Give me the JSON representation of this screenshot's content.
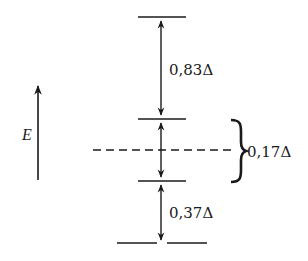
{
  "diagram": {
    "type": "energy-level-diagram",
    "axis": {
      "label": "E",
      "direction": "up"
    },
    "levels": [
      {
        "name": "top",
        "y": 17
      },
      {
        "name": "upper-middle",
        "y": 119
      },
      {
        "name": "barycenter-dashed",
        "y": 150,
        "style": "dashed"
      },
      {
        "name": "lower-middle",
        "y": 181
      },
      {
        "name": "bottom",
        "y": 243
      }
    ],
    "gaps": [
      {
        "label": "0,83Δ",
        "from": "upper-middle",
        "to": "top"
      },
      {
        "label": "0,17Δ",
        "from": "lower-middle",
        "to": "upper-middle",
        "annotation": "brace"
      },
      {
        "label": "0,37Δ",
        "from": "bottom",
        "to": "lower-middle"
      }
    ]
  }
}
